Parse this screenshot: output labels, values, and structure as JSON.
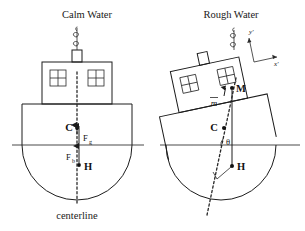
{
  "figure": {
    "caption_left": "Calm Water",
    "caption_right": "Rough Water",
    "centerline_label": "centerline"
  },
  "calm_water": {
    "title": "Calm Water",
    "points": [
      {
        "id": "C",
        "label": "C",
        "meaning": "center-of-gravity"
      },
      {
        "id": "H",
        "label": "H",
        "meaning": "center-of-buoyancy"
      }
    ],
    "forces": [
      {
        "id": "Fg",
        "symbol": "F",
        "subscript": "g",
        "direction": "down",
        "meaning": "gravity-force"
      },
      {
        "id": "Fb",
        "symbol": "F",
        "subscript": "b",
        "direction": "up",
        "meaning": "buoyancy-force"
      }
    ],
    "centerline_label": "centerline"
  },
  "rough_water": {
    "title": "Rough Water",
    "points": [
      {
        "id": "M",
        "label": "M",
        "meaning": "metacenter"
      },
      {
        "id": "C",
        "label": "C",
        "meaning": "center-of-gravity"
      },
      {
        "id": "H",
        "label": "H",
        "meaning": "center-of-buoyancy"
      }
    ],
    "distance_label": "m",
    "angle_label": "θ",
    "axes": [
      {
        "id": "y-prime",
        "label": "y'"
      },
      {
        "id": "x-prime",
        "label": "x'"
      }
    ]
  },
  "colors": {
    "ink": "#1c1c1c",
    "waterline": "#4a4a4a",
    "background": "#ffffff"
  }
}
